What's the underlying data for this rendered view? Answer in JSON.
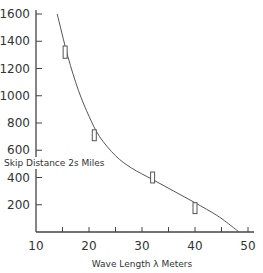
{
  "chart_data": {
    "type": "line",
    "title": "",
    "xlabel": "Wave Length λ Meters",
    "ylabel": "Skip Distance 2s Miles",
    "xlim": [
      10,
      50
    ],
    "ylim": [
      0,
      1600
    ],
    "x_ticks": [
      "10",
      "20",
      "30",
      "40",
      "50"
    ],
    "y_ticks": [
      "200",
      "400",
      "600",
      "800",
      "1000",
      "1200",
      "1400",
      "1600"
    ],
    "grid": false,
    "legend": null,
    "series": [
      {
        "name": "skip distance curve",
        "x": [
          14,
          16,
          18,
          20,
          22,
          25,
          28,
          32,
          36,
          40,
          44,
          46,
          48.3
        ],
        "y": [
          1600,
          1290,
          1040,
          850,
          700,
          560,
          470,
          385,
          300,
          215,
          125,
          70,
          0
        ]
      },
      {
        "name": "observed points (error bars)",
        "x": [
          15.5,
          21,
          32,
          40
        ],
        "y": [
          1320,
          710,
          400,
          175
        ],
        "y_err": [
          45,
          40,
          40,
          40
        ]
      }
    ]
  },
  "labels": {
    "xlabel": "Wave Length λ Meters",
    "ylabel": "Skip Distance 2s Miles",
    "x_ticks": [
      "10",
      "20",
      "30",
      "40",
      "50"
    ],
    "y_ticks": [
      "200",
      "400",
      "600",
      "800",
      "1000",
      "1200",
      "1400",
      "1600"
    ]
  }
}
